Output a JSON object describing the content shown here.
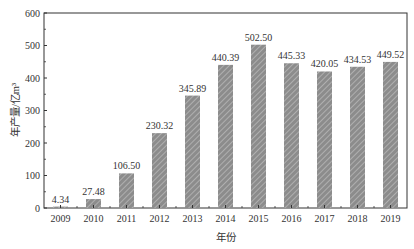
{
  "chart_data": {
    "type": "bar",
    "title": "",
    "xlabel": "年份",
    "ylabel": "年产量/亿m³",
    "ylim": [
      0,
      600
    ],
    "yticks": [
      0,
      100,
      200,
      300,
      400,
      500,
      600
    ],
    "grid": false,
    "legend": null,
    "categories": [
      "2009",
      "2010",
      "2011",
      "2012",
      "2013",
      "2014",
      "2015",
      "2016",
      "2017",
      "2018",
      "2019"
    ],
    "values": [
      4.34,
      27.48,
      106.5,
      230.32,
      345.89,
      440.39,
      502.5,
      445.33,
      420.05,
      434.53,
      449.52
    ],
    "value_labels": [
      "4.34",
      "27.48",
      "106.50",
      "230.32",
      "345.89",
      "440.39",
      "502.50",
      "445.33",
      "420.05",
      "434.53",
      "449.52"
    ],
    "bar_style": "diagonal hatched gray"
  },
  "colors": {
    "bar_fill": "#8c8c8c",
    "bar_hatch": "#b8b8b8",
    "axis": "#333333"
  }
}
